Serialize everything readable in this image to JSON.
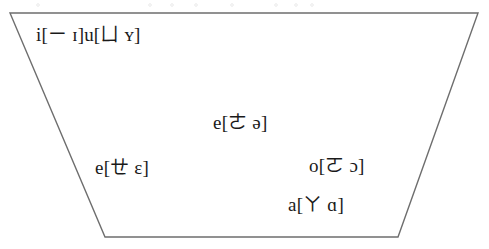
{
  "figure": {
    "kind": "vowel-trapezoid",
    "background_color": "#ffffff",
    "stroke_color": "#6e6e6e",
    "text_color": "#1a1a1a",
    "outline": {
      "top_left": [
        10,
        13
      ],
      "top_right": [
        478,
        13
      ],
      "bottom_right": [
        398,
        237
      ],
      "bottom_left": [
        105,
        237
      ]
    }
  },
  "labels": {
    "high_front_and_high_rounded": "i[ㄧ ɪ]u[ㄩ ʏ]",
    "mid_central": "e[ㄜ ə]",
    "mid_front": "e[ㄝ ɛ]",
    "mid_back": "o[ㄛ ɔ]",
    "low_back": "a[ㄚ ɑ]"
  },
  "chart_data": {
    "type": "scatter",
    "title": "",
    "xlabel": "",
    "ylabel": "",
    "grid": false,
    "legend": null,
    "shape": "trapezoid",
    "shape_vertices": [
      [
        10,
        13
      ],
      [
        478,
        13
      ],
      [
        398,
        237
      ],
      [
        105,
        237
      ]
    ],
    "annotations": [
      {
        "text": "i[ㄧ ɪ]u[ㄩ ʏ]",
        "romanization": "i, u",
        "bopomofo": [
          "ㄧ",
          "ㄩ"
        ],
        "ipa": [
          "ɪ",
          "ʏ"
        ],
        "position": "high-front",
        "x": 36,
        "y": 25
      },
      {
        "text": "e[ㄜ ə]",
        "romanization": "e",
        "bopomofo": [
          "ㄜ"
        ],
        "ipa": [
          "ə"
        ],
        "position": "mid-central",
        "x": 213,
        "y": 113
      },
      {
        "text": "e[ㄝ ɛ]",
        "romanization": "e",
        "bopomofo": [
          "ㄝ"
        ],
        "ipa": [
          "ɛ"
        ],
        "position": "mid-front",
        "x": 95,
        "y": 158
      },
      {
        "text": "o[ㄛ ɔ]",
        "romanization": "o",
        "bopomofo": [
          "ㄛ"
        ],
        "ipa": [
          "ɔ"
        ],
        "position": "mid-back",
        "x": 309,
        "y": 156
      },
      {
        "text": "a[ㄚ ɑ]",
        "romanization": "a",
        "bopomofo": [
          "ㄚ"
        ],
        "ipa": [
          "ɑ"
        ],
        "position": "low-back",
        "x": 288,
        "y": 195
      }
    ]
  }
}
